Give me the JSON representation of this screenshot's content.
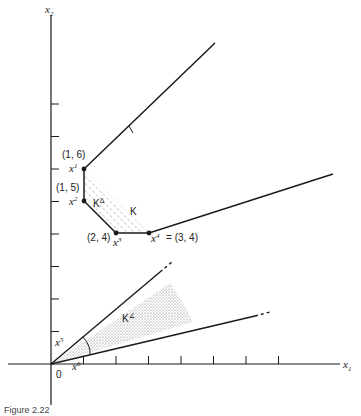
{
  "figure": {
    "caption": "Figure 2.22",
    "axes": {
      "x_label": "x",
      "x_sub": "1",
      "y_label": "x",
      "y_sub": "2",
      "origin_label": "0",
      "x_ticks": [
        1,
        2,
        3,
        4,
        5,
        6,
        7,
        8
      ],
      "y_ticks": [
        1,
        2,
        3,
        4,
        5,
        6,
        7,
        8
      ]
    },
    "points": [
      {
        "name": "x",
        "sup": "1",
        "coords": "(1, 6)"
      },
      {
        "name": "x",
        "sup": "2",
        "coords": "(1, 5)"
      },
      {
        "name": "x",
        "sup": "3",
        "coords": "(2, 4)"
      },
      {
        "name": "x",
        "sup": "4",
        "coords": "(3, 4)",
        "eq": "="
      }
    ],
    "direction_labels": [
      {
        "name": "x",
        "sup": "5"
      },
      {
        "name": "x",
        "sup": "6"
      }
    ],
    "region_labels": {
      "K": "K",
      "K_delta": "K",
      "K_delta_sup": "Δ",
      "K_angle": "K",
      "K_angle_sup": "∠"
    },
    "colors": {
      "ink": "#1a1a1a",
      "stipple": "#777777"
    }
  }
}
